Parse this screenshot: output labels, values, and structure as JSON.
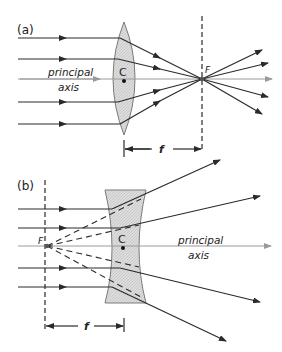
{
  "panel_a": {
    "label": "(a)",
    "axis_label_line1": "principal",
    "axis_label_line2": "axis",
    "center_label": "C",
    "focus_label": "F",
    "focal_length_label": "f",
    "lens_type": "converging (convex)"
  },
  "panel_b": {
    "label": "(b)",
    "axis_label_line1": "principal",
    "axis_label_line2": "axis",
    "center_label": "C",
    "focus_label": "F",
    "focal_length_label": "f",
    "lens_type": "diverging (concave)"
  },
  "colors": {
    "ray": "#2a2a2a",
    "axis": "#9a9a9a",
    "lens_fill": "#d6d6d6",
    "lens_stroke": "#7a7a7a"
  }
}
